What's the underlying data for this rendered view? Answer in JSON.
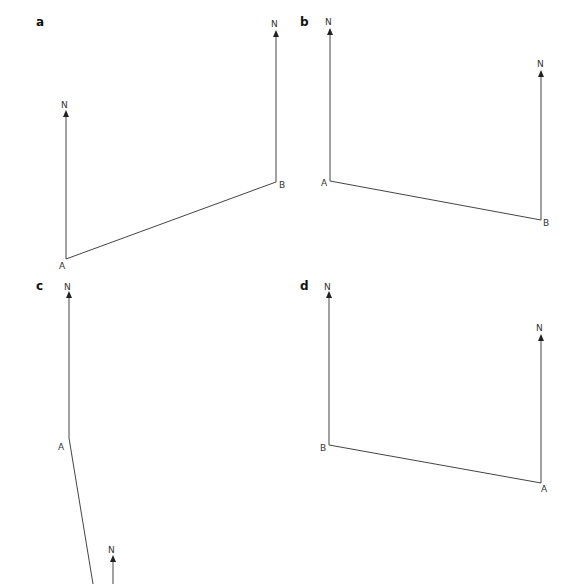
{
  "panels": [
    {
      "id": "a",
      "label": "a",
      "point1": "A",
      "point2": "B",
      "north": "N",
      "A": [
        66,
        259
      ],
      "B": [
        276,
        182
      ],
      "northA_top": [
        66,
        110
      ],
      "northB_top": [
        276,
        30
      ]
    },
    {
      "id": "b",
      "label": "b",
      "point1": "A",
      "point2": "B",
      "north": "N",
      "A": [
        330,
        181
      ],
      "B": [
        541,
        220
      ],
      "northA_top": [
        330,
        28
      ],
      "northB_top": [
        541,
        70
      ]
    },
    {
      "id": "c",
      "label": "c",
      "point1": "A",
      "north": "N",
      "A": [
        69,
        438
      ],
      "B": [
        92,
        584
      ],
      "northA_top": [
        69,
        291
      ],
      "northB_top": [
        113,
        555
      ]
    },
    {
      "id": "d",
      "label": "d",
      "point1": "B",
      "point2": "A",
      "north": "N",
      "B": [
        329,
        445
      ],
      "A": [
        540,
        483
      ],
      "northB_top": [
        329,
        291
      ],
      "northA_top": [
        540,
        334
      ]
    }
  ],
  "colors": {
    "line": "#444444",
    "text": "#333333"
  }
}
